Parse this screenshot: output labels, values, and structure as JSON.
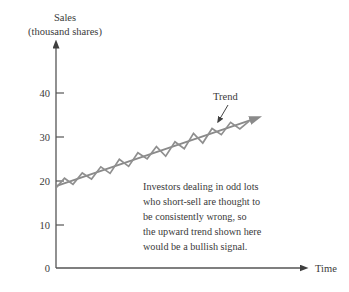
{
  "chart_data": {
    "type": "line",
    "title": "",
    "ylabel_line1": "Sales",
    "ylabel_line2": "(thousand shares)",
    "xlabel": "Time",
    "ylim": [
      0,
      48
    ],
    "xlim": [
      0,
      20
    ],
    "grid": false,
    "legend": "none",
    "ytick_labels": [
      "40",
      "30",
      "20",
      "10",
      "0"
    ],
    "ytick_values": [
      40,
      30,
      20,
      10,
      0
    ],
    "xtick_labels": [],
    "series": [
      {
        "name": "Sales (zigzag)",
        "color": "#8f8f8f",
        "x": [
          0,
          0.55,
          1.1,
          1.7,
          2.3,
          2.9,
          3.5,
          4.1,
          4.7,
          5.3,
          5.9,
          6.5,
          7.1,
          7.7,
          8.3,
          8.9,
          9.5,
          10.1,
          10.7,
          11.3,
          11.9,
          12.5
        ],
        "values": [
          18.2,
          20.4,
          19.0,
          21.6,
          20.2,
          23.0,
          21.5,
          24.7,
          23.1,
          26.2,
          24.8,
          27.6,
          25.4,
          28.7,
          27.1,
          30.6,
          28.4,
          31.7,
          30.3,
          33.1,
          31.6,
          33.4
        ]
      },
      {
        "name": "Trend",
        "color": "#8a8a8a",
        "x": [
          0,
          12.6
        ],
        "values": [
          18.6,
          33.6
        ],
        "label": "Trend",
        "arrow": true
      }
    ],
    "annotations": [
      {
        "name": "commentary",
        "lines": [
          "Investors dealing in odd lots",
          "who short-sell are thought to",
          "be consistently wrong, so",
          "the upward trend shown here",
          "would be a bullish signal."
        ]
      }
    ],
    "colors": {
      "background": "#ffffff",
      "axis": "#555555",
      "data": "#8f8f8f",
      "trend": "#8a8a8a",
      "text": "#3a3a3a"
    }
  }
}
